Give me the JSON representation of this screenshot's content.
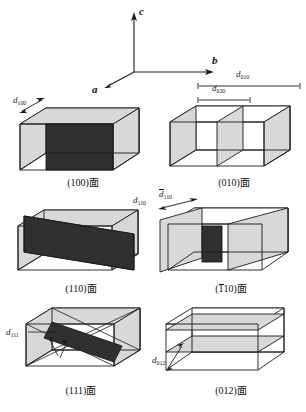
{
  "figure": {
    "axes": {
      "a_label": "a",
      "b_label": "b",
      "c_label": "c"
    },
    "top_spacings": [
      {
        "name": "d010",
        "base": "d",
        "sub": "010"
      },
      {
        "name": "d020",
        "base": "d",
        "sub": "020"
      }
    ],
    "panels": [
      {
        "id": "panel-100",
        "caption_prefix": "(",
        "caption_indices": "100",
        "caption_suffix": ")面",
        "caption": "(100)面",
        "spacing_label": {
          "base": "d",
          "sub": "100"
        },
        "plane_count": 1,
        "plane_shade": "dark"
      },
      {
        "id": "panel-010",
        "caption_prefix": "(",
        "caption_indices": "010",
        "caption_suffix": ")面",
        "caption": "(010)面",
        "spacing_label": {
          "base": "d",
          "sub": "020"
        },
        "plane_count": 3,
        "plane_shade": "light"
      },
      {
        "id": "panel-110",
        "caption_prefix": "(",
        "caption_indices": "110",
        "caption_suffix": ")面",
        "caption": "(110)面",
        "spacing_label": {
          "base": "d",
          "sub": "110"
        },
        "plane_count": 1,
        "plane_shade": "dark"
      },
      {
        "id": "panel-1bar10",
        "caption_prefix": "(",
        "caption_indices": "110",
        "caption_overbar_first": true,
        "caption_suffix": ")面",
        "caption": "(110)面",
        "spacing_label": {
          "base": "d",
          "sub": "110",
          "overbar": true
        },
        "plane_count": 3,
        "plane_shade": "mixed"
      },
      {
        "id": "panel-111",
        "caption_prefix": "(",
        "caption_indices": "111",
        "caption_suffix": ")面",
        "caption": "(111)面",
        "spacing_label": {
          "base": "d",
          "sub": "111"
        },
        "plane_count": 1,
        "plane_shade": "dark"
      },
      {
        "id": "panel-012",
        "caption_prefix": "(",
        "caption_indices": "012",
        "caption_suffix": ")面",
        "caption": "(012)面",
        "spacing_label": {
          "base": "d",
          "sub": "012"
        },
        "plane_count": 2,
        "plane_shade": "light"
      }
    ],
    "colors": {
      "line": "#1a1a1a",
      "light_plane": "#d8d8d8",
      "dark_plane": "#303030",
      "background": "#ffffff"
    }
  }
}
